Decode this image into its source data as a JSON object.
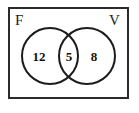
{
  "figure": {
    "type": "venn-diagram",
    "border_color": "#2b2b2b",
    "circle_color": "#1c1c1c",
    "text_color": "#121212",
    "background_color": "#ffffff"
  },
  "sets": {
    "left": {
      "label": "F",
      "only_value": "12"
    },
    "right": {
      "label": "V",
      "only_value": "8"
    },
    "intersection": {
      "value": "5"
    }
  }
}
